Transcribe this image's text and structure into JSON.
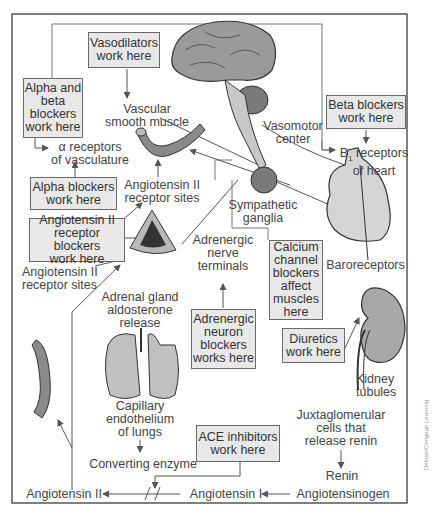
{
  "diagram": {
    "boxes": {
      "vasodilators": "Vasodilators\nwork here",
      "alpha_beta": "Alpha and\nbeta\nblockers\nwork here",
      "beta_blockers": "Beta blockers\nwork here",
      "alpha_blockers": "Alpha blockers\nwork here",
      "arb": "Angiotensin II\nreceptor blockers\nwork here",
      "calcium": "Calcium\nchannel\nblockers\naffect\nmuscles\nhere",
      "adrenergic_blockers": "Adrenergic\nneuron\nblockers\nworks here",
      "diuretics": "Diuretics\nwork here",
      "ace": "ACE inhibitors\nwork here"
    },
    "labels": {
      "vascular_smooth_muscle": "Vascular\nsmooth muscle",
      "alpha_receptors": "α receptors\nof vasculature",
      "vasomotor_center": "Vasomotor\ncenter",
      "b1_receptors_line1": "B",
      "b1_sub": "1",
      "b1_receptors_rest": " receptors",
      "b1_receptors_line2": "of heart",
      "angiotensin_receptor_sites_1": "Angiotensin II\nreceptor sites",
      "sympathetic_ganglia": "Sympathetic\nganglia",
      "adrenergic_nerve_terminals": "Adrenergic\nnerve\nterminals",
      "baroreceptors": "Baroreceptors",
      "angiotensin_receptor_sites_2": "Angiotensin II\nreceptor sites",
      "adrenal_gland": "Adrenal gland\naldosterone\nrelease",
      "kidney_tubules": "Kidney\ntubules",
      "capillary_endothelium": "Capillary\nendothelium\nof lungs",
      "juxtaglomerular": "Juxtaglomerular\ncells that\nrelease renin",
      "converting_enzyme": "Converting enzyme",
      "renin": "Renin",
      "angiotensin_ii": "Angiotensin II",
      "angiotensin_i": "Angiotensin I",
      "angiotensinogen": "Angiotensinogen"
    },
    "credit": "Delmar/Cengage Learning",
    "colors": {
      "box_fill": "#e8e8e8",
      "box_border": "#6a6a6a",
      "organ_gray": "#8a8a8a",
      "organ_light": "#c8c8c8",
      "line": "#555555"
    }
  }
}
